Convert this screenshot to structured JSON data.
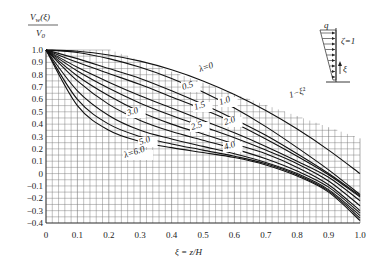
{
  "chart_data": {
    "type": "line",
    "title": "",
    "ylabel": "V_w(ξ) / V_0",
    "xlabel": "ξ = z/H",
    "xlim": [
      0,
      1.0
    ],
    "ylim": [
      -0.4,
      1.0
    ],
    "grid": true,
    "x_ticks": [
      "0",
      "0.1",
      "0.2",
      "0.3",
      "0.4",
      "0.5",
      "0.6",
      "0.7",
      "0.8",
      "0.9",
      "1.0"
    ],
    "y_ticks": [
      "1.0",
      "0.9",
      "0.8",
      "0.7",
      "0.6",
      "0.5",
      "0.4",
      "0.3",
      "0.2",
      "0.1",
      "0",
      "-0.1",
      "-0.2",
      "-0.3",
      "-0.4"
    ],
    "x": [
      0,
      0.1,
      0.2,
      0.3,
      0.4,
      0.5,
      0.6,
      0.7,
      0.8,
      0.9,
      1.0
    ],
    "series": [
      {
        "name": "1-ξ²",
        "label": "1−ξ²",
        "values": [
          1.0,
          0.99,
          0.96,
          0.91,
          0.84,
          0.75,
          0.64,
          0.51,
          0.36,
          0.19,
          0.0
        ]
      },
      {
        "name": "λ=0",
        "label": "λ=0",
        "values": [
          1.0,
          0.98,
          0.93,
          0.86,
          0.77,
          0.66,
          0.53,
          0.38,
          0.21,
          0.03,
          -0.17
        ]
      },
      {
        "name": "λ=0.5",
        "label": "0.5",
        "values": [
          1.0,
          0.93,
          0.85,
          0.77,
          0.67,
          0.56,
          0.44,
          0.31,
          0.16,
          0.0,
          -0.18
        ]
      },
      {
        "name": "λ=1.0",
        "label": "1.0",
        "values": [
          1.0,
          0.9,
          0.81,
          0.72,
          0.62,
          0.52,
          0.41,
          0.28,
          0.14,
          -0.01,
          -0.19
        ]
      },
      {
        "name": "λ=1.5",
        "label": "1.5",
        "values": [
          1.0,
          0.86,
          0.74,
          0.63,
          0.53,
          0.43,
          0.33,
          0.22,
          0.1,
          -0.03,
          -0.22
        ]
      },
      {
        "name": "λ=2.0",
        "label": "2.0",
        "values": [
          1.0,
          0.83,
          0.69,
          0.57,
          0.47,
          0.38,
          0.29,
          0.19,
          0.08,
          -0.06,
          -0.26
        ]
      },
      {
        "name": "λ=2.5",
        "label": "2.5",
        "values": [
          1.0,
          0.79,
          0.63,
          0.5,
          0.4,
          0.32,
          0.24,
          0.16,
          0.05,
          -0.09,
          -0.3
        ]
      },
      {
        "name": "λ=3.0",
        "label": "3.0",
        "values": [
          1.0,
          0.75,
          0.56,
          0.43,
          0.34,
          0.27,
          0.2,
          0.12,
          0.02,
          -0.11,
          -0.32
        ]
      },
      {
        "name": "λ=4.0",
        "label": "4.0",
        "values": [
          1.0,
          0.67,
          0.47,
          0.35,
          0.28,
          0.22,
          0.16,
          0.09,
          0.0,
          -0.13,
          -0.34
        ]
      },
      {
        "name": "λ=5.0",
        "label": "5.0",
        "values": [
          1.0,
          0.6,
          0.4,
          0.3,
          0.24,
          0.19,
          0.14,
          0.08,
          -0.01,
          -0.14,
          -0.36
        ]
      },
      {
        "name": "λ=6.0",
        "label": "λ=6.0",
        "values": [
          1.0,
          0.55,
          0.35,
          0.26,
          0.21,
          0.17,
          0.13,
          0.07,
          -0.02,
          -0.15,
          -0.38
        ]
      }
    ],
    "inset": {
      "load_label": "q",
      "param_label": "ζ=1",
      "axis_label": "ξ"
    }
  }
}
